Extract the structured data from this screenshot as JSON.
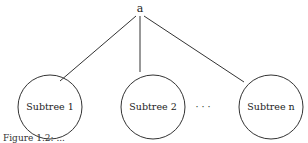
{
  "diagram": {
    "root": {
      "label": "a"
    },
    "children": [
      {
        "label": "Subtree 1"
      },
      {
        "label": "Subtree 2"
      },
      {
        "label": "Subtree n"
      }
    ],
    "ellipsis": "· · ·",
    "caption": "Figure 1.2: ..."
  }
}
